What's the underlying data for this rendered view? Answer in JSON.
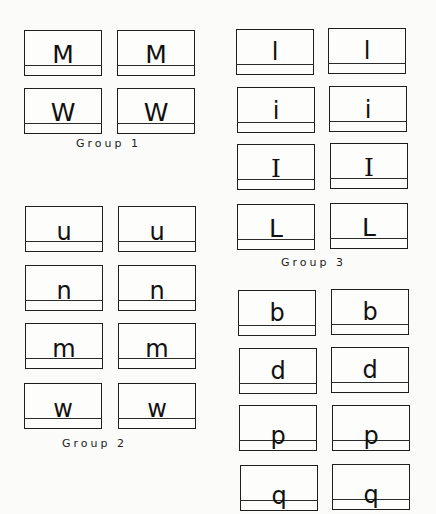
{
  "groups": [
    {
      "label": "Group 1",
      "rows": [
        {
          "letter": "M",
          "case": "upper"
        },
        {
          "letter": "W",
          "case": "upper"
        }
      ]
    },
    {
      "label": "Group 2",
      "rows": [
        {
          "letter": "u",
          "case": "lower"
        },
        {
          "letter": "n",
          "case": "lower"
        },
        {
          "letter": "m",
          "case": "lower"
        },
        {
          "letter": "w",
          "case": "lower"
        }
      ]
    },
    {
      "label": "Group 3",
      "rows": [
        {
          "letter": "l",
          "case": "lower"
        },
        {
          "letter": "i",
          "case": "lower"
        },
        {
          "letter": "I",
          "case": "upper"
        },
        {
          "letter": "L",
          "case": "upper"
        }
      ]
    },
    {
      "label": "",
      "rows": [
        {
          "letter": "b",
          "case": "lower"
        },
        {
          "letter": "d",
          "case": "lower"
        },
        {
          "letter": "p",
          "case": "descender"
        },
        {
          "letter": "q",
          "case": "descender"
        }
      ]
    }
  ],
  "g1": {
    "label": "Group 1",
    "r0": "M",
    "r1": "W"
  },
  "g2": {
    "label": "Group 2",
    "r0": "u",
    "r1": "n",
    "r2": "m",
    "r3": "w"
  },
  "g3": {
    "label": "Group 3",
    "r0": "l",
    "r1": "i",
    "r2": "I",
    "r3": "L"
  },
  "g4": {
    "r0": "b",
    "r1": "d",
    "r2": "p",
    "r3": "q"
  }
}
